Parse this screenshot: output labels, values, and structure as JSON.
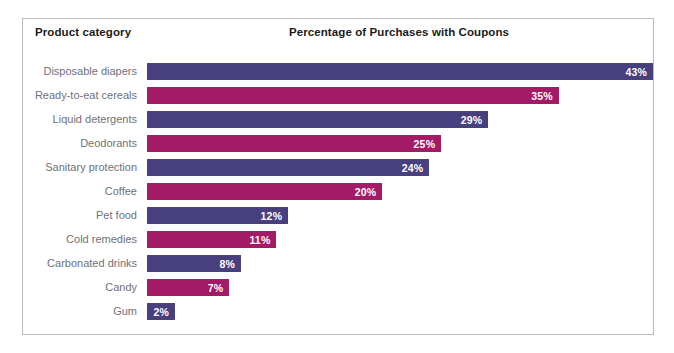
{
  "header": {
    "category_column_label": "Product category",
    "title": "Percentage of Purchases with Coupons"
  },
  "colors": {
    "purple": "#473f7e",
    "magenta": "#a31a67",
    "label_text": "#70707a",
    "header_text": "#1b1b1b",
    "frame_border": "#b9b9b9",
    "background": "#ffffff",
    "value_text": "#ffffff"
  },
  "chart_data": {
    "type": "bar",
    "orientation": "horizontal",
    "title": "Percentage of Purchases with Coupons",
    "xlabel": "",
    "ylabel": "Product category",
    "xlim": [
      0,
      43
    ],
    "grid": false,
    "legend": "none",
    "value_suffix": "%",
    "categories": [
      "Disposable diapers",
      "Ready-to-eat cereals",
      "Liquid detergents",
      "Deodorants",
      "Sanitary protection",
      "Coffee",
      "Pet food",
      "Cold remedies",
      "Carbonated drinks",
      "Candy",
      "Gum"
    ],
    "values": [
      43,
      35,
      29,
      25,
      24,
      20,
      12,
      11,
      8,
      7,
      2
    ],
    "value_labels": [
      "43%",
      "35%",
      "29%",
      "25%",
      "24%",
      "20%",
      "12%",
      "11%",
      "8%",
      "7%",
      "2%"
    ],
    "bar_colors": [
      "purple",
      "magenta",
      "purple",
      "magenta",
      "purple",
      "magenta",
      "purple",
      "magenta",
      "purple",
      "magenta",
      "purple"
    ]
  }
}
